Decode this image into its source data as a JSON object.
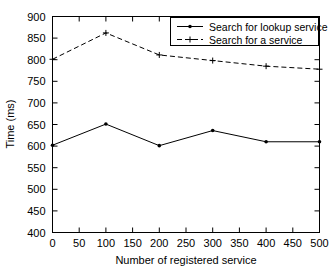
{
  "chart_data": {
    "type": "line",
    "title": "",
    "xlabel": "Number of registered service",
    "ylabel": "Time (ms)",
    "xlim": [
      0,
      500
    ],
    "ylim": [
      400,
      900
    ],
    "xticks": [
      0,
      50,
      100,
      150,
      200,
      250,
      300,
      350,
      400,
      450,
      500
    ],
    "xtick_labels": [
      "0",
      "50",
      "100",
      "150",
      "200",
      "250",
      "300",
      "350",
      "400",
      "450",
      "500"
    ],
    "yticks": [
      400,
      450,
      500,
      550,
      600,
      650,
      700,
      750,
      800,
      850,
      900
    ],
    "ytick_labels": [
      "400",
      "450",
      "500",
      "550",
      "600",
      "650",
      "700",
      "750",
      "800",
      "850",
      "900"
    ],
    "grid": false,
    "legend_position": "top-right",
    "x": [
      0,
      100,
      200,
      300,
      400,
      500
    ],
    "series": [
      {
        "name": "Search for lookup service",
        "values": [
          602,
          651,
          601,
          636,
          610,
          610
        ],
        "line_style": "solid",
        "marker": "dot",
        "color": "#000000"
      },
      {
        "name": "Search for a service",
        "values": [
          801,
          862,
          811,
          798,
          785,
          778
        ],
        "line_style": "dashed",
        "marker": "plus",
        "color": "#000000"
      }
    ]
  },
  "legend": {
    "entries": [
      {
        "label": "Search for lookup service"
      },
      {
        "label": "Search for a service"
      }
    ]
  },
  "axes": {
    "x_title": "Number of registered service",
    "y_title": "Time (ms)"
  }
}
